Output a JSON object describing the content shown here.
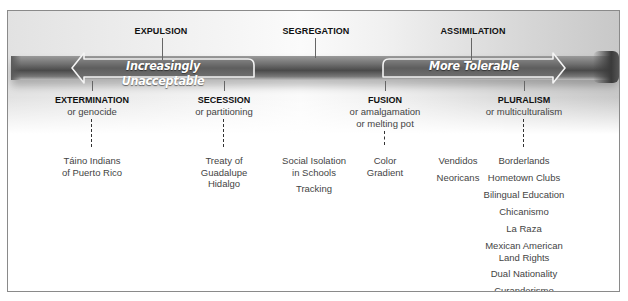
{
  "diagram": {
    "type": "spectrum",
    "arrows": {
      "left": {
        "label": "Increasingly Unacceptable",
        "direction": "left"
      },
      "right": {
        "label": "More Tolerable",
        "direction": "right"
      }
    },
    "top_labels": [
      {
        "id": "expulsion",
        "label": "EXPULSION"
      },
      {
        "id": "segregation",
        "label": "SEGREGATION"
      },
      {
        "id": "assimilation",
        "label": "ASSIMILATION"
      }
    ],
    "strategies": [
      {
        "id": "extermination",
        "name": "EXTERMINATION",
        "alt": [
          "or genocide"
        ],
        "examples": [
          "Táino Indians of Puerto Rico"
        ]
      },
      {
        "id": "secession",
        "name": "SECESSION",
        "alt": [
          "or partitioning"
        ],
        "examples": [
          "Treaty of Guadalupe Hidalgo"
        ]
      },
      {
        "id": "segregation",
        "examples": [
          "Social Isolation in Schools",
          "Tracking"
        ]
      },
      {
        "id": "fusion",
        "name": "FUSION",
        "alt": [
          "or amalgamation",
          "or melting pot"
        ],
        "examples": [
          "Color Gradient"
        ]
      },
      {
        "id": "assimilation",
        "examples": [
          "Vendidos",
          "Neoricans"
        ]
      },
      {
        "id": "pluralism",
        "name": "PLURALISM",
        "alt": [
          "or multiculturalism"
        ],
        "examples": [
          "Borderlands",
          "Hometown Clubs",
          "Bilingual Education",
          "Chicanismo",
          "La Raza",
          "Mexican American Land Rights",
          "Dual Nationality",
          "Curanderismo"
        ]
      }
    ]
  },
  "text": {
    "extermination_ex1_l1": "Táino Indians",
    "extermination_ex1_l2": "of Puerto Rico",
    "secession_ex1_l1": "Treaty of",
    "secession_ex1_l2": "Guadalupe",
    "secession_ex1_l3": "Hidalgo",
    "segregation_ex1_l1": "Social Isolation",
    "segregation_ex1_l2": "in Schools",
    "segregation_ex2": "Tracking",
    "fusion_ex1_l1": "Color",
    "fusion_ex1_l2": "Gradient",
    "mexam_l1": "Mexican American",
    "mexam_l2": "Land Rights"
  },
  "colors": {
    "bar_dark": "#4a4a4a",
    "arrow_fill": "#6a6a6a",
    "arrow_outline": "#f2f2f2",
    "frame_border": "#8a8a8a",
    "label_text": "#111111",
    "body_text": "#444444"
  }
}
